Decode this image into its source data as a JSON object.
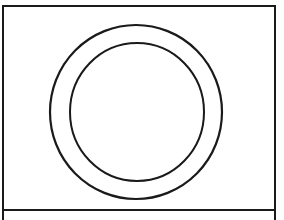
{
  "figure": {
    "stroke_color": "#1a1a1a",
    "background_color": "#ffffff",
    "outer_circle": {
      "cx": 136,
      "cy": 112,
      "rx": 86,
      "ry": 87
    },
    "inner_circle": {
      "cx": 137,
      "cy": 112,
      "rx": 67,
      "ry": 69
    }
  },
  "caption_panel": {
    "text": ""
  }
}
